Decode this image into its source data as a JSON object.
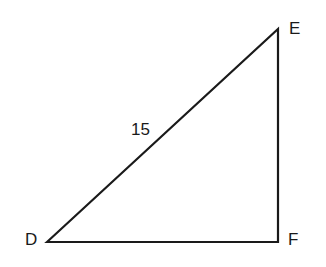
{
  "diagram": {
    "type": "right-triangle",
    "vertices": {
      "D": {
        "label": "D",
        "x": 47,
        "y": 242
      },
      "E": {
        "label": "E",
        "x": 278,
        "y": 29
      },
      "F": {
        "label": "F",
        "x": 278,
        "y": 242
      }
    },
    "side_labels": {
      "DE": "15"
    },
    "line_color": "#1a1a1a"
  }
}
